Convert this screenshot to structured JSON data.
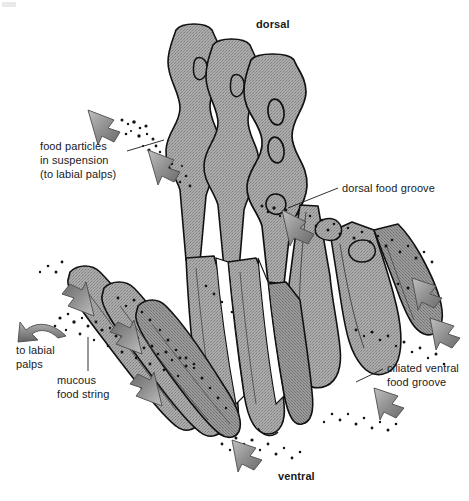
{
  "figure": {
    "background_color": "#ffffff",
    "tissue_fill_color": "#a0a0a0",
    "outline_color": "#111111",
    "arrow_color": "#8c8c8c",
    "particle_color": "#141414",
    "text_color": "#1a1a1a"
  },
  "corner": {
    "mark": ""
  },
  "orientation": {
    "dorsal": "dorsal",
    "ventral": "ventral"
  },
  "labels": {
    "food_particles": {
      "line1": "food particles",
      "line2": "in suspension",
      "line3": "(to labial palps)"
    },
    "dorsal_food_groove": "dorsal food groove",
    "ciliated_ventral_food_groove": {
      "line1": "ciliated ventral",
      "line2": "food groove"
    },
    "to_labial_palps": {
      "line1": "to labial",
      "line2": "palps"
    },
    "mucous_food_string": {
      "line1": "mucous",
      "line2": "food string"
    }
  },
  "annotations": {
    "leader_lines": 3,
    "flow_arrows": 9,
    "particle_trails": 6
  }
}
